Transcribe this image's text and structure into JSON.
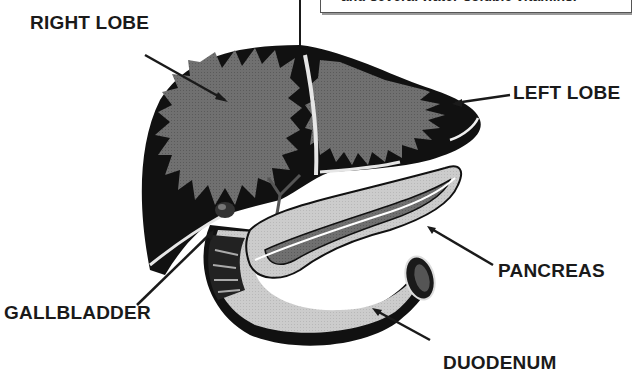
{
  "diagram": {
    "infobox": {
      "text_partial": "and several water-soluble vitamins."
    },
    "labels": {
      "right_lobe": "RIGHT LOBE",
      "left_lobe": "LEFT LOBE",
      "gallbladder": "GALLBLADDER",
      "pancreas": "PANCREAS",
      "duodenum": "DUODENUM"
    },
    "colors": {
      "liver_dark": "#111111",
      "liver_inner": "#6e6e6e",
      "pancreas_light": "#c8c8c8",
      "pancreas_dark": "#707070",
      "duodenum": "#cfcfcf",
      "line": "#1a1a1a",
      "background": "#ffffff"
    }
  }
}
